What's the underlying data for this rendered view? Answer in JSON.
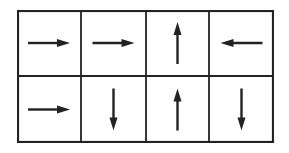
{
  "diagram": {
    "type": "arrow-grid",
    "rows": 2,
    "cols": 4,
    "line_color": "#222222",
    "cells": [
      [
        "right",
        "right",
        "up",
        "left"
      ],
      [
        "right",
        "down",
        "up",
        "down"
      ]
    ]
  }
}
